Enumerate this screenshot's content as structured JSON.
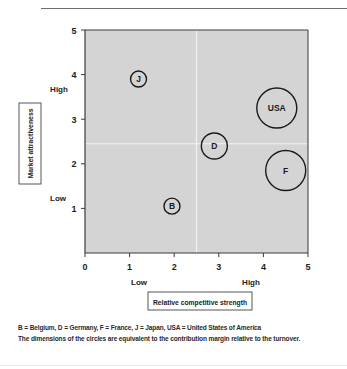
{
  "chart_data": {
    "type": "bubble",
    "title": "",
    "xlabel": "Relative competitive strength",
    "ylabel": "Market attractiveness",
    "xlim": [
      0,
      5
    ],
    "ylim": [
      0,
      5
    ],
    "x_ticks": [
      "0",
      "1",
      "2",
      "3",
      "4",
      "5"
    ],
    "y_ticks": [
      "1",
      "2",
      "3",
      "4",
      "5"
    ],
    "x_qualitative": {
      "low": "Low",
      "high": "High"
    },
    "y_qualitative": {
      "low": "Low",
      "high": "High"
    },
    "divider": {
      "x": 2.5,
      "y": 2.45
    },
    "grid": false,
    "points": [
      {
        "label": "J",
        "country": "Japan",
        "x": 1.2,
        "y": 3.9,
        "r": 8
      },
      {
        "label": "USA",
        "country": "United States of America",
        "x": 4.3,
        "y": 3.25,
        "r": 20
      },
      {
        "label": "D",
        "country": "Germany",
        "x": 2.9,
        "y": 2.4,
        "r": 13
      },
      {
        "label": "F",
        "country": "France",
        "x": 4.5,
        "y": 1.85,
        "r": 20
      },
      {
        "label": "B",
        "country": "Belgium",
        "x": 1.95,
        "y": 1.05,
        "r": 8
      }
    ],
    "legend_note": "B = Belgium, D = Germany, F = France, J = Japan, USA = United States of America",
    "annotation": "The dimensions of the circles are equivalent to the contribution margin relative to the turnover."
  },
  "colors": {
    "plot_bg": "#d4d4d4",
    "divider": "#f2f2f2",
    "axis": "#3a3a3a",
    "bubble_stroke": "#1a1a1a"
  }
}
